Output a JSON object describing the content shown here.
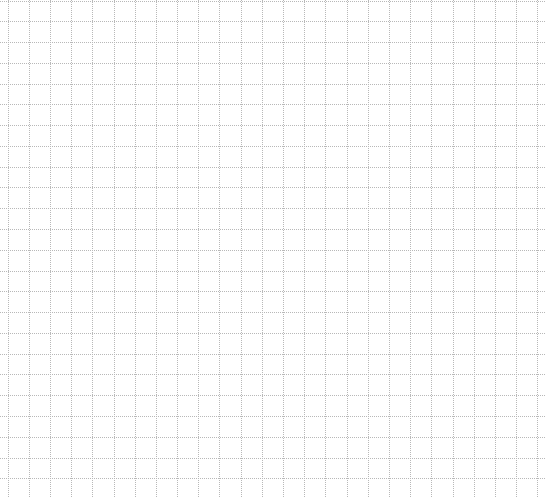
{
  "canvas": {
    "width": 545,
    "height": 497,
    "background": "#ffffff"
  },
  "grid": {
    "style": "dotted",
    "line_color": "#b8b8b8",
    "cell_size": 21.2,
    "x_offset": 7.5,
    "y_offset": 0.5,
    "columns": 26,
    "rows": 24
  }
}
